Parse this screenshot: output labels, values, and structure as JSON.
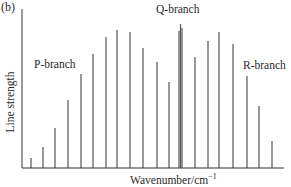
{
  "chart_data": {
    "type": "bar",
    "subtype": "stick-spectrum",
    "title": "",
    "panel_label": "(b)",
    "xlabel": "Wavenumber/cm",
    "xlabel_superscript": "−1",
    "ylabel": "Line strength",
    "grid": false,
    "legend": null,
    "axes": {
      "x_ticks": [],
      "y_ticks": []
    },
    "annotations": [
      {
        "text": "P-branch",
        "near": "left lines"
      },
      {
        "text": "Q-branch",
        "near": "central cluster"
      },
      {
        "text": "R-branch",
        "near": "right lines"
      }
    ],
    "series": [
      {
        "name": "P-branch",
        "x": [
          31,
          43,
          55,
          68,
          81,
          93,
          106,
          117,
          130,
          143,
          157,
          169
        ],
        "values": [
          10,
          21,
          40,
          68,
          94,
          114,
          131,
          138,
          136,
          120,
          106,
          86
        ]
      },
      {
        "name": "Q-branch",
        "x": [
          179,
          180.5,
          182
        ],
        "values": [
          137,
          144,
          140
        ]
      },
      {
        "name": "R-branch",
        "x": [
          195,
          208,
          219,
          233,
          247,
          259,
          272
        ],
        "values": [
          111,
          127,
          136,
          124,
          92,
          62,
          27
        ]
      }
    ],
    "baseline_y_px": 168,
    "units_note": "values are relative line heights in pixels above baseline"
  },
  "labels": {
    "panel": "(b)",
    "ylabel": "Line strength",
    "xlabel": "Wavenumber/cm",
    "xlabel_sup": "−1",
    "p_branch": "P-branch",
    "q_branch": "Q-branch",
    "r_branch": "R-branch"
  },
  "colors": {
    "line": "#333333",
    "q_line": "#555555",
    "axis": "#333333"
  }
}
